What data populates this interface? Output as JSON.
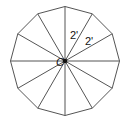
{
  "diagram": {
    "shape": "regular dodecagon",
    "sides": 12,
    "center_label": "C",
    "radius_labels": [
      "2'",
      "2'"
    ],
    "stroke_color": "#555555",
    "center_dot_color": "#111111",
    "label_color": "#111111"
  }
}
